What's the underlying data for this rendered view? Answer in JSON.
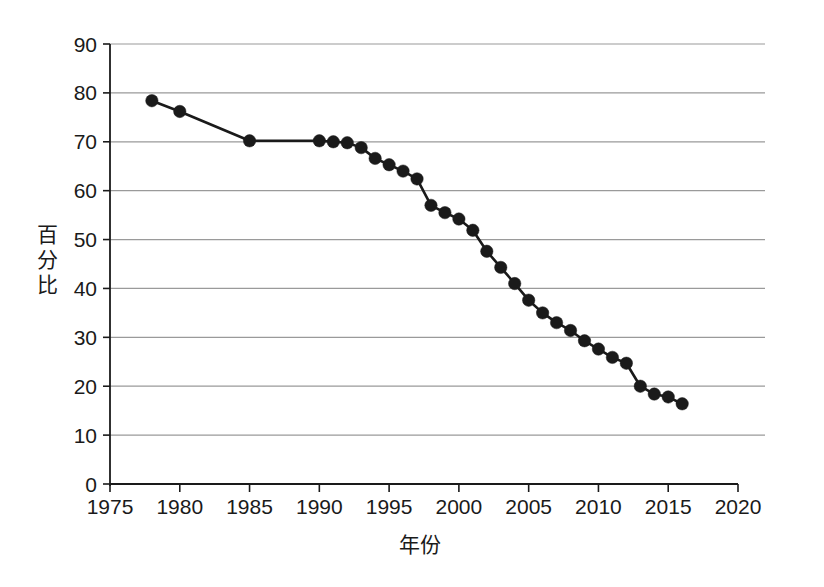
{
  "chart_data": {
    "type": "line",
    "title": "",
    "xlabel": "年份",
    "ylabel": "百分比",
    "xlim": [
      1975,
      2020
    ],
    "ylim": [
      0,
      90
    ],
    "xticks": [
      1975,
      1980,
      1985,
      1990,
      1995,
      2000,
      2005,
      2010,
      2015,
      2020
    ],
    "yticks": [
      0,
      10,
      20,
      30,
      40,
      50,
      60,
      70,
      80,
      90
    ],
    "grid": "horizontal",
    "legend": "none",
    "marker": "filled-circle",
    "line_color": "#1a1a1a",
    "marker_color": "#1a1a1a",
    "grid_color": "#9a9a9a",
    "axis_color": "#1a1a1a",
    "background": "#ffffff",
    "x": [
      1978,
      1980,
      1985,
      1990,
      1991,
      1992,
      1993,
      1994,
      1995,
      1996,
      1997,
      1998,
      1999,
      2000,
      2001,
      2002,
      2003,
      2004,
      2005,
      2006,
      2007,
      2008,
      2009,
      2010,
      2011,
      2012,
      2013,
      2014,
      2015,
      2016
    ],
    "values": [
      78.4,
      76.2,
      70.2,
      70.2,
      70.0,
      69.8,
      68.8,
      66.6,
      65.3,
      64.0,
      62.4,
      57.0,
      55.5,
      54.2,
      51.9,
      47.6,
      44.3,
      41.0,
      37.6,
      35.0,
      33.0,
      31.4,
      29.3,
      27.6,
      25.9,
      24.7,
      20.0,
      18.4,
      17.8,
      16.4
    ],
    "series": [
      {
        "name": "百分比",
        "points": [
          {
            "x": 1978,
            "y": 78.4
          },
          {
            "x": 1980,
            "y": 76.2
          },
          {
            "x": 1985,
            "y": 70.2
          },
          {
            "x": 1990,
            "y": 70.2
          },
          {
            "x": 1991,
            "y": 70.0
          },
          {
            "x": 1992,
            "y": 69.8
          },
          {
            "x": 1993,
            "y": 68.8
          },
          {
            "x": 1994,
            "y": 66.6
          },
          {
            "x": 1995,
            "y": 65.3
          },
          {
            "x": 1996,
            "y": 64.0
          },
          {
            "x": 1997,
            "y": 62.4
          },
          {
            "x": 1998,
            "y": 57.0
          },
          {
            "x": 1999,
            "y": 55.5
          },
          {
            "x": 2000,
            "y": 54.2
          },
          {
            "x": 2001,
            "y": 51.9
          },
          {
            "x": 2002,
            "y": 47.6
          },
          {
            "x": 2003,
            "y": 44.3
          },
          {
            "x": 2004,
            "y": 41.0
          },
          {
            "x": 2005,
            "y": 37.6
          },
          {
            "x": 2006,
            "y": 35.0
          },
          {
            "x": 2007,
            "y": 33.0
          },
          {
            "x": 2008,
            "y": 31.4
          },
          {
            "x": 2009,
            "y": 29.3
          },
          {
            "x": 2010,
            "y": 27.6
          },
          {
            "x": 2011,
            "y": 25.9
          },
          {
            "x": 2012,
            "y": 24.7
          },
          {
            "x": 2013,
            "y": 20.0
          },
          {
            "x": 2014,
            "y": 18.4
          },
          {
            "x": 2015,
            "y": 17.8
          },
          {
            "x": 2016,
            "y": 16.4
          }
        ]
      }
    ]
  },
  "axis": {
    "y_title_chars": [
      "百",
      "分",
      "比"
    ],
    "x_title": "年份"
  }
}
